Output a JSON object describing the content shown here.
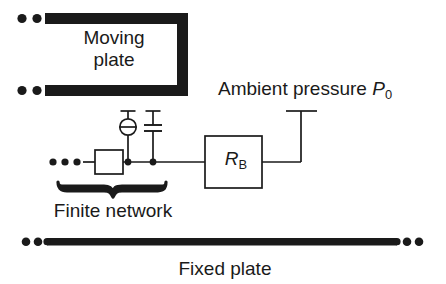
{
  "figure": {
    "kind": "schematic-diagram",
    "background_color": "#ffffff",
    "line_color": "#1a1a1a",
    "text_color": "#1a1a1a"
  },
  "labels": {
    "moving_plate_line1": "Moving",
    "moving_plate_line2": "plate",
    "ambient_pressure_text": "Ambient pressure ",
    "ambient_pressure_symbol": "P",
    "ambient_pressure_subscript": "0",
    "finite_network": "Finite network",
    "fixed_plate": "Fixed plate",
    "resistor_symbol": "R",
    "resistor_subscript": "B"
  },
  "elements": {
    "moving_plate_bracket": "moving-plate-bracket",
    "moving_plate_upper_dots": "continuation-dots",
    "moving_plate_lower_dots": "continuation-dots",
    "network_dots": "continuation-dots",
    "unlabeled_resistor_box": "series-element-box",
    "inductor_circle": "circle-element-with-horizontal-bar",
    "capacitor": "capacitor-two-plates",
    "junction_dot_left": "junction-dot",
    "junction_dot_right": "junction-dot",
    "rb_box": "resistor-box",
    "ambient_terminal": "t-terminal",
    "brace": "underbrace",
    "fixed_plate_bar": "fixed-plate-bar",
    "fixed_plate_left_dots": "continuation-dots",
    "fixed_plate_right_dots": "continuation-dots"
  }
}
